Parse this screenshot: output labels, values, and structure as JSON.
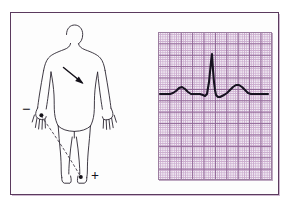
{
  "figure": {
    "border_color": "#5b3a5e",
    "background_color": "#fdfdfd"
  },
  "body_diagram": {
    "name": "human-body-outline",
    "outline_color": "#2a2530",
    "negative_electrode": {
      "label": "−",
      "position": "left-arm-hand",
      "dot_color": "#151218"
    },
    "positive_electrode": {
      "label": "+",
      "position": "right-leg-ankle",
      "dot_color": "#151218"
    },
    "lead_axis": {
      "name": "lead-ii-axis-dashed-line",
      "style": "dashed",
      "from": "left-hand",
      "to": "right-foot"
    },
    "heart_vector_arrow": {
      "name": "heart-depolarization-arrow",
      "direction": "down-right",
      "color": "#1a1620"
    }
  },
  "ecg_paper": {
    "name": "ecg-graph-paper",
    "paper_color": "#f2ecf4",
    "fine_grid_color": "#c9a9cd",
    "bold_grid_color": "#8b5f91",
    "fine_grid_px": 2.28,
    "bold_grid_px": 11.4,
    "trace_color": "#171320"
  },
  "chart_data": {
    "type": "line",
    "xlabel": "Time",
    "ylabel": "Amplitude",
    "grid": true,
    "legend": "none",
    "xlim": [
      0,
      114
    ],
    "ylim": [
      0,
      148
    ],
    "series": [
      {
        "name": "ecg-lead-ii",
        "annotations": [
          "P wave",
          "QRS complex",
          "T wave"
        ],
        "points": [
          [
            2,
            62
          ],
          [
            8,
            62
          ],
          [
            12,
            62
          ],
          [
            15,
            61
          ],
          [
            18,
            59
          ],
          [
            21,
            56
          ],
          [
            24,
            55
          ],
          [
            27,
            57
          ],
          [
            30,
            60
          ],
          [
            33,
            62
          ],
          [
            38,
            62
          ],
          [
            42,
            62
          ],
          [
            45,
            63
          ],
          [
            47,
            64
          ],
          [
            49,
            62
          ],
          [
            51,
            50
          ],
          [
            52,
            40
          ],
          [
            53,
            30
          ],
          [
            54,
            22
          ],
          [
            55,
            38
          ],
          [
            56,
            50
          ],
          [
            57,
            58
          ],
          [
            58,
            63
          ],
          [
            60,
            65
          ],
          [
            62,
            65
          ],
          [
            64,
            64
          ],
          [
            66,
            63
          ],
          [
            69,
            61
          ],
          [
            72,
            58
          ],
          [
            75,
            55
          ],
          [
            78,
            53
          ],
          [
            81,
            53
          ],
          [
            84,
            55
          ],
          [
            87,
            58
          ],
          [
            90,
            61
          ],
          [
            93,
            62
          ],
          [
            97,
            62
          ],
          [
            103,
            62
          ],
          [
            110,
            62
          ]
        ]
      }
    ]
  }
}
